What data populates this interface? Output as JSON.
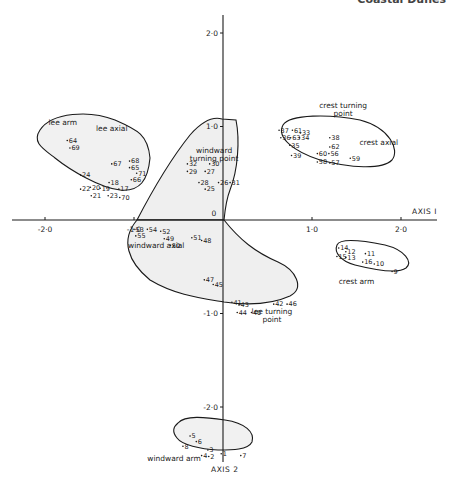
{
  "page": {
    "running_head_left": "",
    "running_head_right": "Coastal Dunes"
  },
  "chart_data": {
    "type": "scatter",
    "title": "",
    "xlabel": "AXIS I",
    "ylabel": "AXIS 2",
    "xlim": [
      -2.5,
      2.6
    ],
    "ylim": [
      -2.8,
      2.3
    ],
    "x_ticks": [
      {
        "value": -2.0,
        "label": "-2·0"
      },
      {
        "value": -1.0,
        "label": "-1·0"
      },
      {
        "value": 0.0,
        "label": "0"
      },
      {
        "value": 1.0,
        "label": "1·0"
      },
      {
        "value": 2.0,
        "label": "2·0"
      }
    ],
    "y_ticks": [
      {
        "value": 2.0,
        "label": "2·0"
      },
      {
        "value": 1.0,
        "label": "1·0"
      },
      {
        "value": -1.0,
        "label": "-1·0"
      },
      {
        "value": -2.0,
        "label": "-2·0"
      }
    ],
    "grid": false,
    "groups": [
      {
        "name": "lee arm",
        "label_at": [
          -1.8,
          1.02
        ]
      },
      {
        "name": "lee axial",
        "label_at": [
          -1.25,
          0.95
        ]
      },
      {
        "name": "windward turning point",
        "label_at": [
          -0.1,
          0.72
        ],
        "multiline": [
          "windward",
          "turning point"
        ]
      },
      {
        "name": "crest turning point",
        "label_at": [
          1.35,
          1.2
        ],
        "multiline": [
          "crest turning",
          "point"
        ]
      },
      {
        "name": "crest axial",
        "label_at": [
          1.75,
          0.8
        ]
      },
      {
        "name": "windward axial",
        "label_at": [
          -0.75,
          -0.3
        ]
      },
      {
        "name": "lee turning point",
        "label_at": [
          0.55,
          -1.0
        ],
        "multiline": [
          "lee turning",
          "point"
        ]
      },
      {
        "name": "crest arm",
        "label_at": [
          1.5,
          -0.68
        ]
      },
      {
        "name": "windward arm",
        "label_at": [
          -0.55,
          -2.58
        ]
      }
    ],
    "points": [
      {
        "id": "64",
        "x": -1.75,
        "y": 0.85
      },
      {
        "id": "69",
        "x": -1.72,
        "y": 0.77
      },
      {
        "id": "67",
        "x": -1.25,
        "y": 0.6
      },
      {
        "id": "68",
        "x": -1.05,
        "y": 0.63
      },
      {
        "id": "65",
        "x": -1.05,
        "y": 0.56
      },
      {
        "id": "71",
        "x": -0.97,
        "y": 0.5
      },
      {
        "id": "66",
        "x": -1.03,
        "y": 0.43
      },
      {
        "id": "24",
        "x": -1.6,
        "y": 0.48
      },
      {
        "id": "22",
        "x": -1.6,
        "y": 0.33
      },
      {
        "id": "20",
        "x": -1.49,
        "y": 0.35
      },
      {
        "id": "19",
        "x": -1.38,
        "y": 0.34
      },
      {
        "id": "18",
        "x": -1.28,
        "y": 0.4
      },
      {
        "id": "17",
        "x": -1.17,
        "y": 0.33
      },
      {
        "id": "21",
        "x": -1.48,
        "y": 0.26
      },
      {
        "id": "23",
        "x": -1.29,
        "y": 0.26
      },
      {
        "id": "70",
        "x": -1.16,
        "y": 0.24
      },
      {
        "id": "32",
        "x": -0.4,
        "y": 0.6
      },
      {
        "id": "30",
        "x": -0.15,
        "y": 0.6
      },
      {
        "id": "29",
        "x": -0.4,
        "y": 0.52
      },
      {
        "id": "27",
        "x": -0.2,
        "y": 0.52
      },
      {
        "id": "28",
        "x": -0.27,
        "y": 0.4
      },
      {
        "id": "26",
        "x": -0.05,
        "y": 0.4
      },
      {
        "id": "25",
        "x": -0.2,
        "y": 0.33
      },
      {
        "id": "31",
        "x": 0.08,
        "y": 0.4
      },
      {
        "id": "37",
        "x": 0.63,
        "y": 0.96
      },
      {
        "id": "61",
        "x": 0.78,
        "y": 0.96
      },
      {
        "id": "33",
        "x": 0.87,
        "y": 0.93
      },
      {
        "id": "36",
        "x": 0.65,
        "y": 0.88
      },
      {
        "id": "63",
        "x": 0.76,
        "y": 0.88
      },
      {
        "id": "34",
        "x": 0.86,
        "y": 0.88
      },
      {
        "id": "35",
        "x": 0.75,
        "y": 0.8
      },
      {
        "id": "38",
        "x": 1.2,
        "y": 0.88
      },
      {
        "id": "62",
        "x": 1.2,
        "y": 0.78
      },
      {
        "id": "39",
        "x": 0.77,
        "y": 0.69
      },
      {
        "id": "60",
        "x": 1.06,
        "y": 0.71
      },
      {
        "id": "56",
        "x": 1.19,
        "y": 0.71
      },
      {
        "id": "58",
        "x": 1.06,
        "y": 0.62
      },
      {
        "id": "57",
        "x": 1.2,
        "y": 0.61
      },
      {
        "id": "59",
        "x": 1.43,
        "y": 0.66
      },
      {
        "id": "53",
        "x": -1.0,
        "y": -0.1
      },
      {
        "id": "54",
        "x": -0.85,
        "y": -0.1
      },
      {
        "id": "55",
        "x": -0.98,
        "y": -0.17
      },
      {
        "id": "52",
        "x": -0.7,
        "y": -0.12
      },
      {
        "id": "49",
        "x": -0.66,
        "y": -0.2
      },
      {
        "id": "50",
        "x": -0.59,
        "y": -0.27
      },
      {
        "id": "51",
        "x": -0.35,
        "y": -0.19
      },
      {
        "id": "48",
        "x": -0.24,
        "y": -0.22
      },
      {
        "id": "47",
        "x": -0.21,
        "y": -0.64
      },
      {
        "id": "45",
        "x": -0.11,
        "y": -0.69
      },
      {
        "id": "41",
        "x": 0.1,
        "y": -0.88
      },
      {
        "id": "43",
        "x": 0.18,
        "y": -0.91
      },
      {
        "id": "44",
        "x": 0.16,
        "y": -0.99
      },
      {
        "id": "40",
        "x": 0.32,
        "y": -0.99
      },
      {
        "id": "42",
        "x": 0.57,
        "y": -0.9
      },
      {
        "id": "46",
        "x": 0.72,
        "y": -0.9
      },
      {
        "id": "14",
        "x": 1.3,
        "y": -0.3
      },
      {
        "id": "12",
        "x": 1.38,
        "y": -0.34
      },
      {
        "id": "15",
        "x": 1.28,
        "y": -0.39
      },
      {
        "id": "13",
        "x": 1.38,
        "y": -0.4
      },
      {
        "id": "11",
        "x": 1.6,
        "y": -0.36
      },
      {
        "id": "16",
        "x": 1.57,
        "y": -0.45
      },
      {
        "id": "10",
        "x": 1.7,
        "y": -0.47
      },
      {
        "id": "9",
        "x": 1.9,
        "y": -0.55
      },
      {
        "id": "5",
        "x": -0.37,
        "y": -2.31
      },
      {
        "id": "6",
        "x": -0.3,
        "y": -2.37
      },
      {
        "id": "8",
        "x": -0.45,
        "y": -2.42
      },
      {
        "id": "3",
        "x": -0.17,
        "y": -2.46
      },
      {
        "id": "4",
        "x": -0.24,
        "y": -2.52
      },
      {
        "id": "2",
        "x": -0.16,
        "y": -2.53
      },
      {
        "id": "1",
        "x": -0.02,
        "y": -2.5
      },
      {
        "id": "7",
        "x": 0.2,
        "y": -2.52
      }
    ]
  }
}
